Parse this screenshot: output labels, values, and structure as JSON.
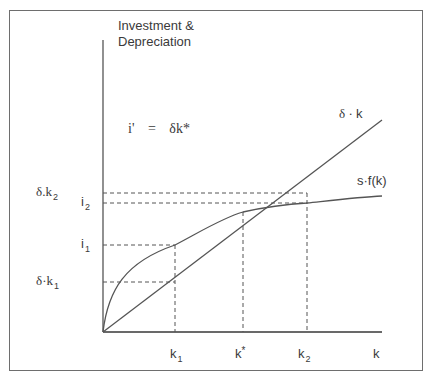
{
  "diagram": {
    "y_axis_title_line1": "Investment &",
    "y_axis_title_line2": "Depreciation",
    "equation": {
      "lhs": "i'",
      "eq": "=",
      "rhs": "δk*"
    },
    "curves": {
      "depreciation_line": {
        "label_prefix": "δ · ",
        "label_var": "k"
      },
      "investment_curve": {
        "label": "s·f(k)"
      }
    },
    "y_ticks": [
      {
        "id": "delta_k2",
        "base": "δ.k",
        "sub": "2"
      },
      {
        "id": "i2",
        "base": "i",
        "sub": "2"
      },
      {
        "id": "i1",
        "base": "i",
        "sub": "1"
      },
      {
        "id": "delta_k1",
        "base": "δ·k",
        "sub": "1"
      }
    ],
    "x_ticks": [
      {
        "id": "k1",
        "base": "k",
        "sub": "1"
      },
      {
        "id": "kstar",
        "base": "k",
        "sup": "*"
      },
      {
        "id": "k2",
        "base": "k",
        "sub": "2"
      },
      {
        "id": "k",
        "base": "k"
      }
    ],
    "colors": {
      "line": "#555555",
      "dash": "#555555",
      "border": "#6e6e6e",
      "background": "#ffffff"
    }
  }
}
